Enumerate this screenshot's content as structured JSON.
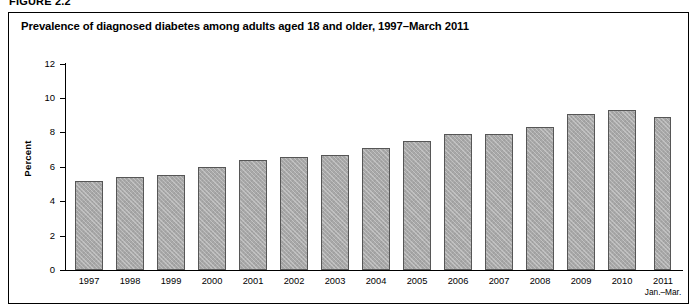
{
  "figure": {
    "label": "FIGURE 2.2",
    "title": "Prevalence of diagnosed diabetes among adults aged 18 and older, 1997–March 2011"
  },
  "colors": {
    "bar_fill": "#a8a8a8",
    "bar_border": "#565656",
    "axis": "#000000",
    "frame": "#000000",
    "background": "#ffffff"
  },
  "chart_data": {
    "type": "bar",
    "title": "Prevalence of diagnosed diabetes among adults aged 18 and older, 1997–March 2011",
    "xlabel": "",
    "ylabel": "Percent",
    "ylim": [
      0,
      12
    ],
    "yticks": [
      0,
      2,
      4,
      6,
      8,
      10,
      12
    ],
    "ytick_labels": [
      "0",
      "2",
      "4",
      "6",
      "8",
      "10",
      "12"
    ],
    "grid": false,
    "legend": null,
    "categories": [
      "1997",
      "1998",
      "1999",
      "2000",
      "2001",
      "2002",
      "2003",
      "2004",
      "2005",
      "2006",
      "2007",
      "2008",
      "2009",
      "2010",
      "2011"
    ],
    "category_sublabels": [
      "",
      "",
      "",
      "",
      "",
      "",
      "",
      "",
      "",
      "",
      "",
      "",
      "",
      "",
      "Jan.–Mar."
    ],
    "values": [
      5.2,
      5.4,
      5.5,
      6.0,
      6.4,
      6.6,
      6.7,
      7.1,
      7.5,
      7.9,
      7.9,
      8.3,
      9.1,
      9.3,
      8.9
    ],
    "series": [
      {
        "name": "Prevalence of diagnosed diabetes",
        "values": [
          5.2,
          5.4,
          5.5,
          6.0,
          6.4,
          6.6,
          6.7,
          7.1,
          7.5,
          7.9,
          7.9,
          8.3,
          9.1,
          9.3,
          8.9
        ]
      }
    ]
  }
}
